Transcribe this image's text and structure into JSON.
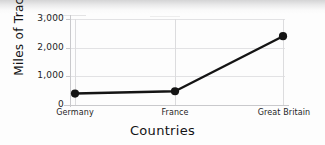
{
  "chart_data": {
    "type": "line",
    "title": "",
    "xlabel": "Countries",
    "ylabel": "Miles of Track",
    "categories": [
      "Germany",
      "France",
      "Great Britain"
    ],
    "values": [
      400,
      480,
      2400
    ],
    "series": [
      {
        "name": "Miles of Track",
        "values": [
          400,
          480,
          2400
        ]
      }
    ],
    "ylim": [
      0,
      3000
    ],
    "yticks": [
      0,
      1000,
      2000,
      3000
    ],
    "ytick_labels": [
      "0",
      "1,000",
      "2,000",
      "3,000"
    ],
    "xtick_labels": [
      "Germany",
      "France",
      "Great Britain"
    ],
    "grid": true,
    "legend": false,
    "legend_position": "none",
    "line_color": "#141414",
    "marker": "circle",
    "marker_color": "#141414",
    "grid_color": "#e2e2e4",
    "axis_color": "#c9c9cc",
    "background_color": "#fdfdfd"
  }
}
